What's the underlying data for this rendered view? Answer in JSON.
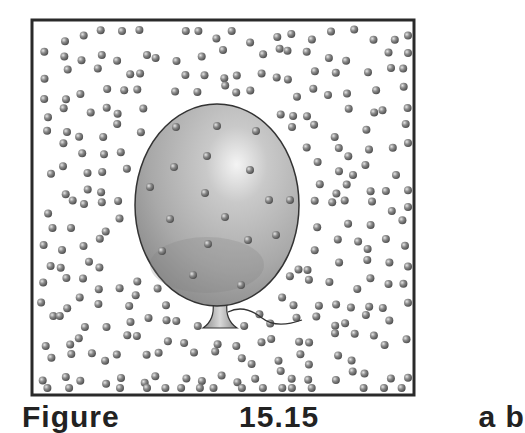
{
  "figure": {
    "caption_label": "Figure",
    "caption_number": "15.15",
    "caption_tail": "a b",
    "frame": {
      "x": 32,
      "y": 20,
      "width": 382,
      "height": 375,
      "stroke": "#2a2a2a",
      "stroke_width": 3
    },
    "balloon": {
      "cx": 217,
      "cy": 205,
      "rx": 82,
      "ry": 101,
      "fill_light": "#e9e9e9",
      "fill_mid": "#b7b7b7",
      "fill_dark": "#8e8e8e",
      "outline": "#3a3a3a",
      "knot": {
        "top_y": 303,
        "bottom_y": 328,
        "top_half_width": 7,
        "bottom_half_width": 17,
        "cx": 220
      },
      "string_path": "M228 312 C 240 306, 252 310, 262 318 S 285 326, 302 320"
    },
    "particle": {
      "radius": 4,
      "color": "#8a8a8a",
      "highlight": "#e0e0e0",
      "shade": "#4e4e4e"
    },
    "outside_particles": {
      "spacing": 19,
      "jitter": 7,
      "seed": 17,
      "region": {
        "x": 38,
        "y": 26,
        "width": 370,
        "height": 362
      },
      "balloon_clearance": 8
    },
    "inside_particles": [
      [
        176,
        127
      ],
      [
        217,
        126
      ],
      [
        256,
        131
      ],
      [
        207,
        156
      ],
      [
        174,
        167
      ],
      [
        250,
        170
      ],
      [
        150,
        187
      ],
      [
        205,
        193
      ],
      [
        269,
        200
      ],
      [
        170,
        219
      ],
      [
        225,
        217
      ],
      [
        208,
        244
      ],
      [
        248,
        240
      ],
      [
        276,
        235
      ],
      [
        162,
        251
      ],
      [
        193,
        275
      ],
      [
        241,
        285
      ],
      [
        290,
        200
      ]
    ]
  }
}
